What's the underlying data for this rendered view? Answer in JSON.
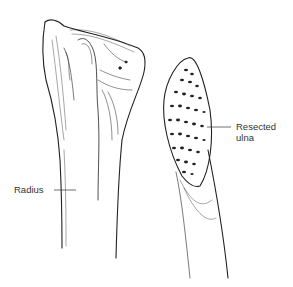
{
  "figure": {
    "labels": {
      "radius": "Radius",
      "ulna_line1": "Resected",
      "ulna_line2": "ulna"
    }
  }
}
